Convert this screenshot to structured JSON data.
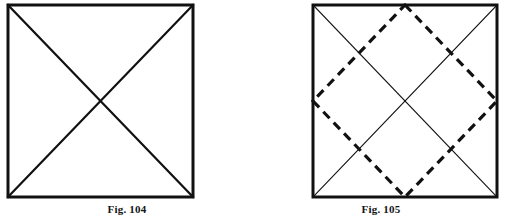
{
  "page": {
    "background_color": "#ffffff",
    "ink_color": "#111111",
    "width": 508,
    "height": 217
  },
  "figures": [
    {
      "id": "fig-104",
      "caption": "Fig. 104",
      "description": "Square with both diagonals drawn as solid bold lines forming an X",
      "square": {
        "x": 8,
        "y": 5,
        "width": 185,
        "height": 192,
        "stroke_color": "#111111",
        "stroke_width": 3
      },
      "diagonals": {
        "style": "solid",
        "stroke_color": "#111111",
        "stroke_width": 2.2,
        "lines": [
          {
            "x1": 8,
            "y1": 5,
            "x2": 193,
            "y2": 197
          },
          {
            "x1": 193,
            "y1": 5,
            "x2": 8,
            "y2": 197
          }
        ]
      },
      "inscribed_square": null
    },
    {
      "id": "fig-105",
      "caption": "Fig. 105",
      "description": "Square with thin diagonals plus a bold dashed inscribed square joining the midpoints of the sides",
      "square": {
        "x": 59,
        "y": 5,
        "width": 184,
        "height": 192,
        "stroke_color": "#111111",
        "stroke_width": 3
      },
      "diagonals": {
        "style": "solid",
        "stroke_color": "#111111",
        "stroke_width": 1.1,
        "lines": [
          {
            "x1": 59,
            "y1": 5,
            "x2": 243,
            "y2": 197
          },
          {
            "x1": 243,
            "y1": 5,
            "x2": 59,
            "y2": 197
          }
        ]
      },
      "inscribed_square": {
        "style": "dashed",
        "stroke_color": "#111111",
        "stroke_width": 3.2,
        "dash_pattern": "9 6",
        "vertices": [
          {
            "x": 151,
            "y": 5,
            "name": "top-midpoint"
          },
          {
            "x": 243,
            "y": 101,
            "name": "right-midpoint"
          },
          {
            "x": 151,
            "y": 197,
            "name": "bottom-midpoint"
          },
          {
            "x": 59,
            "y": 101,
            "name": "left-midpoint"
          }
        ]
      }
    }
  ]
}
